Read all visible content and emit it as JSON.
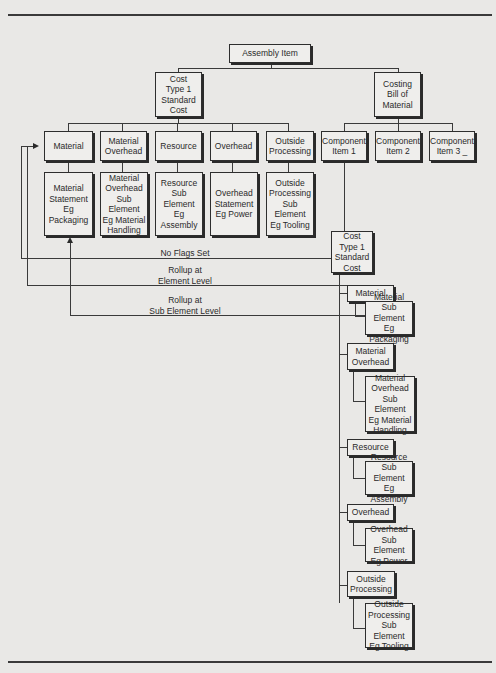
{
  "diagram": {
    "root": "Assembly Item",
    "cost_type": "Cost\nType 1\nStandard\nCost",
    "costing_bom": "Costing\nBill of\nMaterial",
    "elements": [
      {
        "label": "Material",
        "sub": "Material\nStatement\nEg Packaging"
      },
      {
        "label": "Material\nOverhead",
        "sub": "Material\nOverhead\nSub Element\nEg Material\nHandling"
      },
      {
        "label": "Resource",
        "sub": "Resource\nSub Element\nEg Assembly"
      },
      {
        "label": "Overhead",
        "sub": "Overhead\nStatement\nEg Power"
      },
      {
        "label": "Outside\nProcessing",
        "sub": "Outside\nProcessing\nSub Element\nEg Tooling"
      }
    ],
    "components": [
      "Component\nItem 1",
      "Component\nItem 2",
      "Component\nItem 3 _"
    ],
    "component_cost_type": "Cost\nType 1\nStandard\nCost",
    "component_elements": [
      {
        "label": "Material",
        "sub": "Material\nSub Element\nEg Packaging"
      },
      {
        "label": "Material\nOverhead",
        "sub": "Material\nOverhead\nSub Element\nEg Material\nHandling"
      },
      {
        "label": "Resource",
        "sub": "Resource\nSub Element\nEg Assembly"
      },
      {
        "label": "Overhead",
        "sub": "Overhead\nSub Element\nEg Power"
      },
      {
        "label": "Outside\nProcessing",
        "sub": "Outside\nProcessing\nSub Element\nEg Tooling"
      }
    ],
    "flows": {
      "no_flags": "No Flags Set",
      "rollup_element": "Rollup at\nElement Level",
      "rollup_sub_element": "Rollup at\nSub Element Level"
    }
  }
}
